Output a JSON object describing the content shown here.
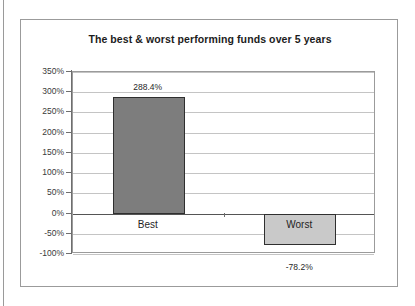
{
  "chart_data": {
    "type": "bar",
    "title": "The best & worst performing funds over 5 years",
    "xlabel": "",
    "ylabel": "",
    "categories": [
      "Best",
      "Worst"
    ],
    "values": [
      288.4,
      -78.2
    ],
    "value_labels": [
      "288.4%",
      "-78.2%"
    ],
    "ylim": [
      -100,
      350
    ],
    "ytick_values": [
      350,
      300,
      250,
      200,
      150,
      100,
      50,
      0,
      -50,
      -100
    ],
    "ytick_labels": [
      "350%",
      "300%",
      "250%",
      "200%",
      "150%",
      "100%",
      "50%",
      "0%",
      "-50%",
      "-100%"
    ],
    "grid": true,
    "legend": false,
    "series_colors": [
      "#7d7d7d",
      "#c9c9c9"
    ]
  },
  "colors": {
    "bar_best": "#7d7d7d",
    "bar_worst": "#c9c9c9",
    "bar_outline": "#2f2f2f",
    "gridline": "#c4c4c4",
    "axis": "#6e6e6e",
    "frame": "#9b9b9b",
    "text": "#1f1f1f"
  }
}
